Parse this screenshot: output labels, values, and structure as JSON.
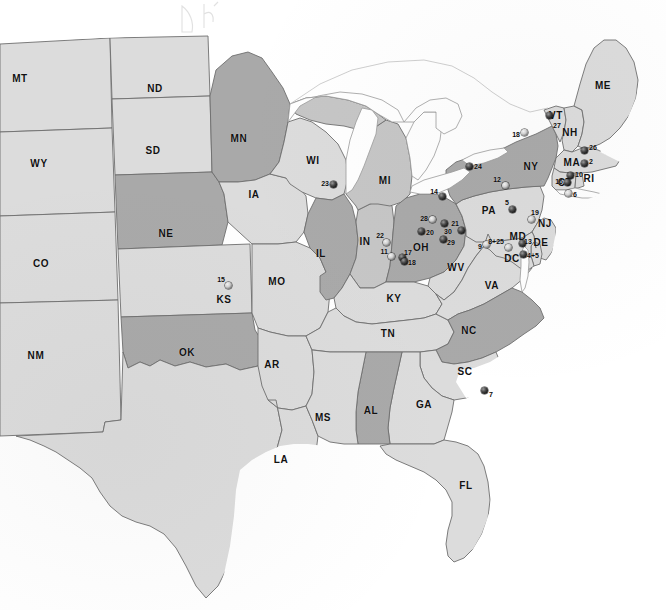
{
  "map": {
    "title": "Eastern and Central United States site location map",
    "background_color": "#ffffff",
    "water_color": "#ffffff",
    "border_color": "#6e6e6e",
    "fill_light": "#dcdcdc",
    "fill_medium": "#c6c6c6",
    "fill_dark": "#a9a9a9",
    "marker_color": "#141414",
    "label_color": "#111111"
  },
  "state_labels": [
    {
      "abbr": "MT",
      "x": 20,
      "y": 78
    },
    {
      "abbr": "ND",
      "x": 155,
      "y": 88
    },
    {
      "abbr": "MN",
      "x": 239,
      "y": 138
    },
    {
      "abbr": "WY",
      "x": 39,
      "y": 163
    },
    {
      "abbr": "SD",
      "x": 153,
      "y": 150
    },
    {
      "abbr": "WI",
      "x": 313,
      "y": 160
    },
    {
      "abbr": "ME",
      "x": 603,
      "y": 85
    },
    {
      "abbr": "IA",
      "x": 254,
      "y": 194
    },
    {
      "abbr": "MI",
      "x": 385,
      "y": 180
    },
    {
      "abbr": "VT",
      "x": 556,
      "y": 115
    },
    {
      "abbr": "NH",
      "x": 570,
      "y": 132
    },
    {
      "abbr": "NY",
      "x": 531,
      "y": 166
    },
    {
      "abbr": "MA",
      "x": 572,
      "y": 162
    },
    {
      "abbr": "NE",
      "x": 166,
      "y": 233
    },
    {
      "abbr": "CT",
      "x": 565,
      "y": 182
    },
    {
      "abbr": "RI",
      "x": 589,
      "y": 178
    },
    {
      "abbr": "PA",
      "x": 489,
      "y": 210
    },
    {
      "abbr": "NJ",
      "x": 545,
      "y": 223
    },
    {
      "abbr": "CO",
      "x": 41,
      "y": 263
    },
    {
      "abbr": "IL",
      "x": 321,
      "y": 253
    },
    {
      "abbr": "IN",
      "x": 365,
      "y": 241
    },
    {
      "abbr": "OH",
      "x": 421,
      "y": 247
    },
    {
      "abbr": "DE",
      "x": 541,
      "y": 242
    },
    {
      "abbr": "MD",
      "x": 518,
      "y": 236
    },
    {
      "abbr": "DC",
      "x": 512,
      "y": 258
    },
    {
      "abbr": "KS",
      "x": 224,
      "y": 299
    },
    {
      "abbr": "MO",
      "x": 277,
      "y": 281
    },
    {
      "abbr": "WV",
      "x": 456,
      "y": 267
    },
    {
      "abbr": "VA",
      "x": 492,
      "y": 285
    },
    {
      "abbr": "KY",
      "x": 394,
      "y": 298
    },
    {
      "abbr": "TN",
      "x": 388,
      "y": 333
    },
    {
      "abbr": "NC",
      "x": 469,
      "y": 330
    },
    {
      "abbr": "NM",
      "x": 36,
      "y": 355
    },
    {
      "abbr": "OK",
      "x": 187,
      "y": 352
    },
    {
      "abbr": "AR",
      "x": 272,
      "y": 364
    },
    {
      "abbr": "SC",
      "x": 465,
      "y": 371
    },
    {
      "abbr": "MS",
      "x": 323,
      "y": 417
    },
    {
      "abbr": "AL",
      "x": 371,
      "y": 410
    },
    {
      "abbr": "GA",
      "x": 424,
      "y": 404
    },
    {
      "abbr": "LA",
      "x": 281,
      "y": 459
    },
    {
      "abbr": "FL",
      "x": 466,
      "y": 485
    }
  ],
  "markers": [
    {
      "id": "27",
      "label": "27",
      "x": 549,
      "y": 115,
      "label_x": 553,
      "label_y": 125,
      "style": "filled"
    },
    {
      "id": "18n",
      "label": "18",
      "x": 524,
      "y": 132,
      "label_x": 520,
      "label_y": 134,
      "align": "left",
      "style": "hollow"
    },
    {
      "id": "26",
      "label": "26",
      "x": 584,
      "y": 150,
      "label_x": 589,
      "label_y": 147,
      "style": "filled"
    },
    {
      "id": "24",
      "label": "24",
      "x": 469,
      "y": 166,
      "label_x": 474,
      "label_y": 166,
      "style": "filled"
    },
    {
      "id": "12",
      "label": "12",
      "x": 505,
      "y": 185,
      "label_x": 501,
      "label_y": 179,
      "align": "left",
      "style": "hollow"
    },
    {
      "id": "2",
      "label": "2",
      "x": 584,
      "y": 163,
      "label_x": 589,
      "label_y": 161,
      "style": "filled"
    },
    {
      "id": "10",
      "label": "10",
      "x": 570,
      "y": 175,
      "label_x": 575,
      "label_y": 174,
      "style": "filled"
    },
    {
      "id": "16",
      "label": "16",
      "x": 567,
      "y": 182,
      "label_x": 563,
      "label_y": 181,
      "align": "left",
      "style": "filled"
    },
    {
      "id": "6",
      "label": "6",
      "x": 568,
      "y": 193,
      "label_x": 573,
      "label_y": 194,
      "style": "hollow"
    },
    {
      "id": "14",
      "label": "14",
      "x": 442,
      "y": 196,
      "label_x": 438,
      "label_y": 191,
      "align": "left",
      "style": "filled"
    },
    {
      "id": "5",
      "label": "5",
      "x": 512,
      "y": 209,
      "label_x": 509,
      "label_y": 202,
      "align": "left",
      "style": "filled"
    },
    {
      "id": "28",
      "label": "28",
      "x": 432,
      "y": 219,
      "label_x": 428,
      "label_y": 218,
      "align": "left",
      "style": "hollow"
    },
    {
      "id": "30",
      "label": "30",
      "x": 444,
      "y": 223,
      "label_x": 444,
      "label_y": 231,
      "style": "filled"
    },
    {
      "id": "19",
      "label": "19",
      "x": 531,
      "y": 219,
      "label_x": 531,
      "label_y": 212,
      "style": "hollow"
    },
    {
      "id": "22",
      "label": "22",
      "x": 386,
      "y": 242,
      "label_x": 384,
      "label_y": 235,
      "align": "left",
      "style": "hollow"
    },
    {
      "id": "20",
      "label": "20",
      "x": 421,
      "y": 231,
      "label_x": 426,
      "label_y": 232,
      "style": "filled"
    },
    {
      "id": "29",
      "label": "29",
      "x": 443,
      "y": 239,
      "label_x": 447,
      "label_y": 242,
      "style": "filled"
    },
    {
      "id": "21",
      "label": "21",
      "x": 461,
      "y": 230,
      "label_x": 459,
      "label_y": 223,
      "align": "left",
      "style": "filled"
    },
    {
      "id": "11",
      "label": "11",
      "x": 391,
      "y": 256,
      "label_x": 388,
      "label_y": 251,
      "align": "left",
      "style": "hollow"
    },
    {
      "id": "17",
      "label": "17",
      "x": 402,
      "y": 257,
      "label_x": 404,
      "label_y": 252,
      "style": "filled"
    },
    {
      "id": "18s",
      "label": "18",
      "x": 404,
      "y": 261,
      "label_x": 408,
      "label_y": 262,
      "style": "filled"
    },
    {
      "id": "9",
      "label": "9",
      "x": 486,
      "y": 244,
      "label_x": 482,
      "label_y": 246,
      "align": "left",
      "style": "hollow"
    },
    {
      "id": "8+25",
      "label": "8+25",
      "x": 508,
      "y": 247,
      "label_x": 504,
      "label_y": 241,
      "align": "left",
      "style": "hollow"
    },
    {
      "id": "13",
      "label": "13",
      "x": 522,
      "y": 243,
      "label_x": 524,
      "label_y": 241,
      "style": "filled"
    },
    {
      "id": "4+5",
      "label": "4+5",
      "x": 523,
      "y": 254,
      "label_x": 527,
      "label_y": 255,
      "style": "filled"
    },
    {
      "id": "15",
      "label": "15",
      "x": 228,
      "y": 285,
      "label_x": 225,
      "label_y": 279,
      "align": "left",
      "style": "hollow"
    },
    {
      "id": "23",
      "label": "23",
      "x": 333,
      "y": 184,
      "label_x": 329,
      "label_y": 183,
      "align": "left",
      "style": "filled"
    },
    {
      "id": "7",
      "label": "7",
      "x": 484,
      "y": 390,
      "label_x": 489,
      "label_y": 394,
      "style": "filled"
    }
  ],
  "annotations": [
    {
      "name": "handwritten-mark-d",
      "x": 186,
      "y": 8
    },
    {
      "name": "handwritten-mark-h",
      "x": 208,
      "y": 6
    }
  ]
}
